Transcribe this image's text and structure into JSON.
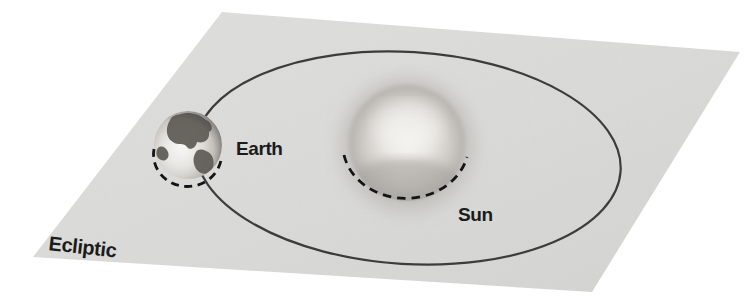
{
  "diagram": {
    "labels": {
      "earth": "Earth",
      "sun": "Sun",
      "ecliptic": "Ecliptic"
    },
    "colors": {
      "background": "#ffffff",
      "plane": "#dcdcda",
      "orbit": "#3c3c3c",
      "dash": "#141414",
      "text": "#1b1b1b"
    }
  }
}
